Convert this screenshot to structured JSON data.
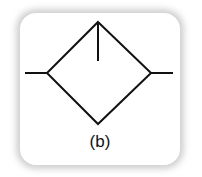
{
  "diagram": {
    "type": "filter-symbol",
    "caption": "(b)",
    "stroke_color": "#111111",
    "card_background": "#ffffff",
    "shape": {
      "diamond": {
        "top": [
          98,
          22
        ],
        "right": [
          151,
          73
        ],
        "bottom": [
          98,
          124
        ],
        "left": [
          47,
          73
        ]
      },
      "left_line": [
        [
          25,
          73
        ],
        [
          47,
          73
        ]
      ],
      "right_line": [
        [
          151,
          73
        ],
        [
          173,
          73
        ]
      ],
      "center_line": [
        [
          98,
          22
        ],
        [
          98,
          61
        ]
      ]
    }
  }
}
